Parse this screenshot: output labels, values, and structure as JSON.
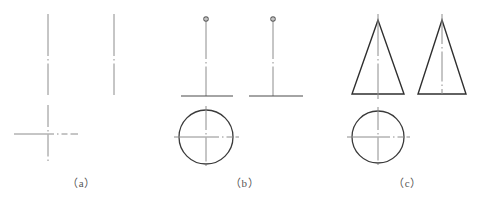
{
  "figure": {
    "background_color": "#ffffff",
    "line_color": "#3a3a3a",
    "centerline_color": "#8c8c8c",
    "caption_color": "#555555",
    "panels": [
      {
        "id": "a",
        "caption": "（a）",
        "description": "Two vertical centerlines and a centerline cross",
        "elements": [
          {
            "name": "front-view-vertical-centerline",
            "type": "centerline-vertical"
          },
          {
            "name": "side-view-vertical-centerline",
            "type": "centerline-vertical"
          },
          {
            "name": "top-view-centerline-cross",
            "type": "centerline-cross"
          }
        ]
      },
      {
        "id": "b",
        "caption": "（b）",
        "description": "Thin vertical member with small circle at top, horizontal base, and circular top view",
        "elements": [
          {
            "name": "front-view-vertical-axis",
            "type": "centerline-vertical"
          },
          {
            "name": "front-view-top-circle-marker",
            "type": "small-circle"
          },
          {
            "name": "front-view-base-line",
            "type": "solid-horizontal"
          },
          {
            "name": "side-view-vertical-axis",
            "type": "centerline-vertical"
          },
          {
            "name": "side-view-top-circle-marker",
            "type": "small-circle"
          },
          {
            "name": "side-view-base-line",
            "type": "solid-horizontal"
          },
          {
            "name": "top-view-circle",
            "type": "circle"
          },
          {
            "name": "top-view-centerline-cross",
            "type": "centerline-cross"
          }
        ]
      },
      {
        "id": "c",
        "caption": "（c）",
        "description": "Cone: two triangular views and a circular top view",
        "elements": [
          {
            "name": "front-view-triangle",
            "type": "triangle"
          },
          {
            "name": "front-view-vertical-centerline",
            "type": "centerline-vertical"
          },
          {
            "name": "side-view-triangle",
            "type": "triangle"
          },
          {
            "name": "side-view-vertical-line",
            "type": "solid-vertical"
          },
          {
            "name": "top-view-circle",
            "type": "circle"
          },
          {
            "name": "top-view-centerline-cross",
            "type": "centerline-cross"
          }
        ]
      }
    ]
  }
}
